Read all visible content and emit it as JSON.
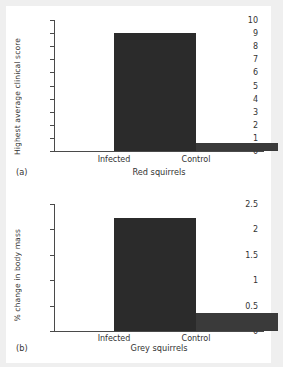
{
  "figure": {
    "background_color": "#ffffff",
    "page_color": "#efefef",
    "bar_color": "#2b2b2b",
    "axis_color": "#4a4a4a"
  },
  "panels": [
    {
      "tag": "(a)",
      "group_label": "Red squirrels",
      "ylabel": "Highest average clinical score",
      "yticks": [
        "10",
        "9",
        "8",
        "7",
        "6",
        "5",
        "4",
        "3",
        "2",
        "1",
        "0"
      ],
      "categories": [
        "Infected",
        "Control"
      ]
    },
    {
      "tag": "(b)",
      "group_label": "Grey squirrels",
      "ylabel": "% change in body mass",
      "yticks": [
        "2.5",
        "2",
        "1.5",
        "1",
        "0.5",
        "0"
      ],
      "categories": [
        "Infected",
        "Control"
      ]
    }
  ],
  "chart_data": [
    {
      "type": "bar",
      "panel": "(a)",
      "title": "Red squirrels",
      "xlabel": "Red squirrels",
      "ylabel": "Highest average clinical score",
      "categories": [
        "Infected",
        "Control"
      ],
      "values": [
        9.0,
        0.6
      ],
      "ylim": [
        0,
        10
      ],
      "ytick_values": [
        0,
        1,
        2,
        3,
        4,
        5,
        6,
        7,
        8,
        9,
        10
      ],
      "ytick_labels": [
        "0",
        "1",
        "2",
        "3",
        "4",
        "5",
        "6",
        "7",
        "8",
        "9",
        "10"
      ],
      "grid": false,
      "legend": false
    },
    {
      "type": "bar",
      "panel": "(b)",
      "title": "Grey squirrels",
      "xlabel": "Grey squirrels",
      "ylabel": "% change in body mass",
      "categories": [
        "Infected",
        "Control"
      ],
      "values": [
        2.22,
        0.36
      ],
      "ylim": [
        0,
        2.5
      ],
      "ytick_values": [
        0,
        0.5,
        1,
        1.5,
        2,
        2.5
      ],
      "ytick_labels": [
        "0",
        "0.5",
        "1",
        "1.5",
        "2",
        "2.5"
      ],
      "grid": false,
      "legend": false
    }
  ]
}
